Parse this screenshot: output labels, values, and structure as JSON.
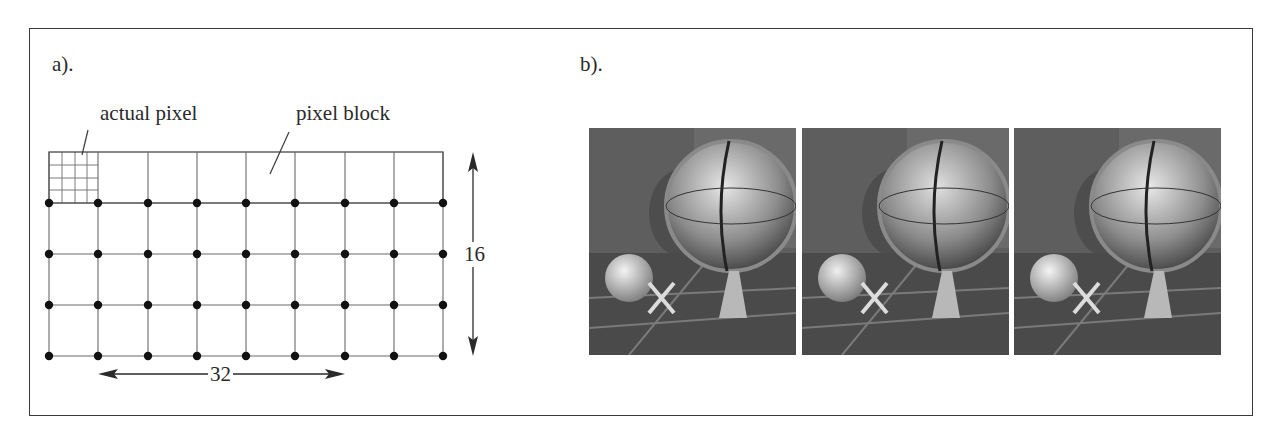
{
  "panels": {
    "a": {
      "label": "a).",
      "annotations": {
        "actual_pixel": "actual pixel",
        "pixel_block": "pixel block"
      },
      "grid": {
        "columns_of_blocks": 8,
        "rows_of_blocks": 4,
        "subpixels_per_block": "4x4",
        "width_label": "32",
        "height_label": "16"
      }
    },
    "b": {
      "label": "b).",
      "images": [
        {
          "subject": "globe-scene-1"
        },
        {
          "subject": "globe-scene-2"
        },
        {
          "subject": "globe-scene-3"
        }
      ]
    }
  },
  "colors": {
    "line": "#3a3a3a",
    "grid": "#8a8a8a",
    "dot": "#111111",
    "photo_bg": "#5b5b5b"
  }
}
